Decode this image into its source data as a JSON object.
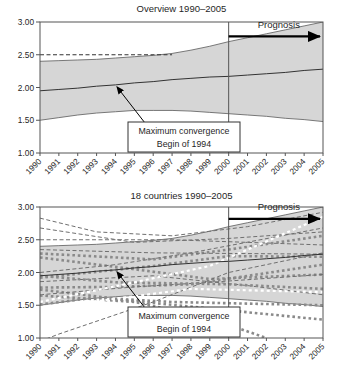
{
  "titles": {
    "overview": "Overview 1990–2005",
    "countries": "18 countries 1990–2005"
  },
  "annotations": {
    "prognosis_label": "Prognosis",
    "note_line1": "Maximum convergence",
    "note_line2": "Begin of 1994"
  },
  "colors": {
    "band_fill": "#d6d6d6",
    "band_edge": "#6a6a6a",
    "mean_line": "#333333",
    "frame": "#555555",
    "text": "#1f1f1f",
    "dashed_level": "#333333",
    "country_dash": "#6f6f6f",
    "country_dot": "#8a8a8a",
    "country_white": "#ffffff",
    "arrow": "#000000"
  },
  "chart_data": [
    {
      "id": "overview",
      "type": "area",
      "title": "Overview 1990–2005",
      "x": [
        1990,
        1991,
        1992,
        1993,
        1994,
        1995,
        1996,
        1997,
        1998,
        1999,
        2000,
        2001,
        2002,
        2003,
        2004,
        2005
      ],
      "x_labels": [
        "1990",
        "1991",
        "1992",
        "1993",
        "1994",
        "1995",
        "1996",
        "1997",
        "1998",
        "1999",
        "2000",
        "2001",
        "2002",
        "2003",
        "2004",
        "2005"
      ],
      "ylim": [
        1.0,
        3.0
      ],
      "y_ticks": [
        3.0,
        2.5,
        2.0,
        1.5,
        1.0
      ],
      "y_tick_labels": [
        "3.00",
        "2.50",
        "2.00",
        "1.50",
        "1.00"
      ],
      "band_upper": [
        2.4,
        2.41,
        2.42,
        2.43,
        2.45,
        2.47,
        2.49,
        2.52,
        2.57,
        2.63,
        2.7,
        2.76,
        2.82,
        2.88,
        2.94,
        3.0
      ],
      "band_lower": [
        1.5,
        1.54,
        1.58,
        1.61,
        1.63,
        1.65,
        1.65,
        1.65,
        1.64,
        1.62,
        1.6,
        1.58,
        1.56,
        1.53,
        1.51,
        1.48
      ],
      "mean_line": [
        1.95,
        1.97,
        1.99,
        2.02,
        2.04,
        2.07,
        2.09,
        2.12,
        2.14,
        2.16,
        2.17,
        2.19,
        2.21,
        2.23,
        2.26,
        2.28
      ],
      "dashed_level": {
        "value": 2.5,
        "from": 1990,
        "to": 1997
      },
      "divider_year": 2000,
      "prognosis": {
        "label": "Prognosis",
        "from": 2000,
        "to": 2005,
        "arrow_value": 2.78,
        "label_value": 2.91
      },
      "note": {
        "lines": [
          "Maximum convergence",
          "Begin of 1994"
        ],
        "target_year": 1994,
        "target_value": 2.04
      }
    },
    {
      "id": "countries",
      "type": "line",
      "title": "18 countries 1990–2005",
      "x": [
        1990,
        1991,
        1992,
        1993,
        1994,
        1995,
        1996,
        1997,
        1998,
        1999,
        2000,
        2001,
        2002,
        2003,
        2004,
        2005
      ],
      "x_labels": [
        "1990",
        "1991",
        "1992",
        "1993",
        "1994",
        "1995",
        "1996",
        "1997",
        "1998",
        "1999",
        "2000",
        "2001",
        "2002",
        "2003",
        "2004",
        "2005"
      ],
      "ylim": [
        1.0,
        3.0
      ],
      "y_ticks": [
        3.0,
        2.5,
        2.0,
        1.5,
        1.0
      ],
      "y_tick_labels": [
        "3.00",
        "2.50",
        "2.00",
        "1.50",
        "1.00"
      ],
      "band_upper": [
        2.4,
        2.41,
        2.42,
        2.43,
        2.45,
        2.47,
        2.49,
        2.52,
        2.57,
        2.63,
        2.7,
        2.76,
        2.82,
        2.88,
        2.94,
        3.0
      ],
      "band_lower": [
        1.5,
        1.54,
        1.58,
        1.61,
        1.63,
        1.65,
        1.65,
        1.65,
        1.64,
        1.62,
        1.6,
        1.58,
        1.56,
        1.53,
        1.51,
        1.48
      ],
      "mean_line": [
        1.95,
        1.97,
        1.99,
        2.02,
        2.04,
        2.07,
        2.09,
        2.12,
        2.14,
        2.16,
        2.17,
        2.19,
        2.21,
        2.23,
        2.26,
        2.28
      ],
      "divider_year": 2000,
      "prognosis": {
        "label": "Prognosis",
        "from": 2000,
        "to": 2005,
        "arrow_value": 2.82,
        "label_value": 2.95
      },
      "note": {
        "lines": [
          "Maximum convergence",
          "Begin of 1994"
        ],
        "target_year": 1994,
        "target_value": 2.04
      },
      "countries": [
        {
          "style": "dash",
          "points": [
            [
              1990,
              2.83
            ],
            [
              1993,
              2.62
            ],
            [
              1997,
              2.56
            ],
            [
              2001,
              2.7
            ],
            [
              2005,
              2.92
            ]
          ]
        },
        {
          "style": "dash",
          "points": [
            [
              1990,
              2.68
            ],
            [
              1995,
              2.46
            ],
            [
              2000,
              2.52
            ],
            [
              2005,
              2.62
            ]
          ]
        },
        {
          "style": "dash",
          "points": [
            [
              1990,
              2.5
            ],
            [
              1997,
              2.5
            ],
            [
              2005,
              2.42
            ]
          ]
        },
        {
          "style": "dot",
          "points": [
            [
              1990,
              2.29
            ],
            [
              1996,
              2.2
            ],
            [
              2000,
              2.35
            ],
            [
              2005,
              2.56
            ]
          ]
        },
        {
          "style": "dot",
          "points": [
            [
              1990,
              2.23
            ],
            [
              1995,
              2.05
            ],
            [
              1999,
              1.9
            ],
            [
              2005,
              1.97
            ]
          ]
        },
        {
          "style": "dash",
          "points": [
            [
              1990,
              2.0
            ],
            [
              1994,
              2.12
            ],
            [
              1998,
              2.3
            ],
            [
              2005,
              2.68
            ]
          ]
        },
        {
          "style": "dot",
          "points": [
            [
              1990,
              1.92
            ],
            [
              1996,
              2.1
            ],
            [
              2000,
              2.25
            ],
            [
              2005,
              2.24
            ]
          ]
        },
        {
          "style": "dash",
          "points": [
            [
              1990,
              1.86
            ],
            [
              1996,
              1.95
            ],
            [
              2001,
              1.8
            ],
            [
              2005,
              1.66
            ]
          ]
        },
        {
          "style": "dot",
          "points": [
            [
              1990,
              1.77
            ],
            [
              1994,
              1.78
            ],
            [
              1998,
              1.82
            ],
            [
              2005,
              2.12
            ]
          ]
        },
        {
          "style": "dot",
          "points": [
            [
              1990,
              1.74
            ],
            [
              1994,
              1.6
            ],
            [
              1997,
              1.55
            ],
            [
              2005,
              1.5
            ]
          ]
        },
        {
          "style": "dash",
          "points": [
            [
              1990,
              1.66
            ],
            [
              1995,
              1.78
            ],
            [
              1999,
              1.85
            ],
            [
              2005,
              1.97
            ]
          ]
        },
        {
          "style": "dot",
          "points": [
            [
              1990,
              1.51
            ],
            [
              1993,
              1.62
            ],
            [
              1999,
              1.45
            ],
            [
              2005,
              1.28
            ]
          ]
        },
        {
          "style": "white",
          "points": [
            [
              1990,
              1.55
            ],
            [
              1995,
              1.85
            ],
            [
              1999,
              2.1
            ],
            [
              2005,
              2.85
            ]
          ]
        },
        {
          "style": "white",
          "points": [
            [
              1990,
              1.45
            ],
            [
              1994,
              1.6
            ],
            [
              1998,
              1.75
            ],
            [
              2005,
              1.7
            ]
          ]
        },
        {
          "style": "dash",
          "points": [
            [
              1990,
              0.95
            ],
            [
              1991,
              1.06
            ],
            [
              1996,
              1.55
            ],
            [
              2000,
              2.0
            ],
            [
              2005,
              2.3
            ]
          ]
        },
        {
          "style": "dot",
          "points": [
            [
              1990,
              1.65
            ],
            [
              1995,
              1.55
            ],
            [
              1999,
              1.3
            ],
            [
              2002,
              1.0
            ]
          ]
        },
        {
          "style": "dash",
          "points": [
            [
              1990,
              2.35
            ],
            [
              1996,
              2.3
            ],
            [
              2005,
              2.28
            ]
          ]
        },
        {
          "style": "dot",
          "points": [
            [
              1990,
              1.95
            ],
            [
              1994,
              1.85
            ],
            [
              2000,
              1.82
            ],
            [
              2005,
              1.75
            ]
          ]
        }
      ]
    }
  ]
}
